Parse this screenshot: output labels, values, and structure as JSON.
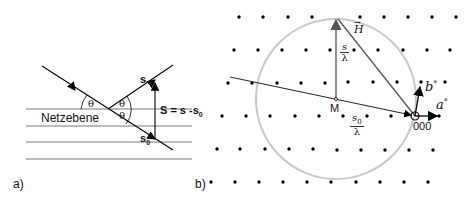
{
  "panel_a": {
    "label": "a)",
    "plane_label": "Netzebene",
    "theta": "θ",
    "vec_s": "s",
    "vec_s0": "s",
    "vec_s0_sub": "0",
    "equation_lhs": "S = s -s",
    "equation_sub": "0"
  },
  "panel_b": {
    "label": "b)",
    "H_label": "H",
    "s_num": "s",
    "s_den": "λ",
    "M_label": "M",
    "s0_num": "s",
    "s0_sub": "0",
    "s0_den": "λ",
    "b_label": "b",
    "a_label": "a",
    "star": "*",
    "origin_label": "000",
    "colors": {
      "circle": "#c8c8c8",
      "vector": "#555555",
      "dot": "#000000"
    }
  }
}
